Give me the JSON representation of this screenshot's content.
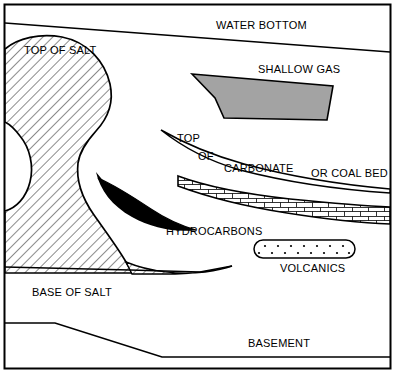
{
  "figure": {
    "border_color": "#000000",
    "background_color": "#ffffff"
  },
  "colors": {
    "line": "#000000",
    "salt_fill": "#ffffff",
    "salt_hatch": "#000000",
    "shallow_gas_fill": "#a3a3a3",
    "hydrocarbons_fill": "#000000",
    "carbonate_fill": "#ffffff",
    "volcanics_fill": "#ffffff"
  },
  "labels": {
    "water_bottom": "WATER BOTTOM",
    "top_of_salt": "TOP OF SALT",
    "shallow_gas": "SHALLOW GAS",
    "top": "TOP",
    "of": "OF",
    "carbonate": "CARBONATE",
    "or_coal_bed": "OR COAL BED",
    "hydrocarbons": "HYDROCARBONS",
    "volcanics": "VOLCANICS",
    "base_of_salt": "BASE OF SALT",
    "basement": "BASEMENT"
  },
  "features": [
    {
      "name": "water-bottom",
      "label": "WATER BOTTOM",
      "type": "horizon-line",
      "description": "Gently dipping seafloor horizon across top of section"
    },
    {
      "name": "salt-body",
      "label": "TOP OF SALT",
      "type": "hatched-body",
      "description": "Diagonally hatched salt diapir occupying left portion"
    },
    {
      "name": "shallow-gas",
      "label": "SHALLOW GAS",
      "type": "filled-polygon",
      "description": "Grey shaded gas anomaly in upper right"
    },
    {
      "name": "carbonate-or-coal-bed",
      "label": "CARBONATE OR COAL BED",
      "type": "brick-pattern-band",
      "description": "Brick patterned dipping bed in right half"
    },
    {
      "name": "hydrocarbons",
      "label": "HYDROCARBONS",
      "type": "solid-black-wedge",
      "description": "Black crescent trapped against salt flank"
    },
    {
      "name": "volcanics",
      "label": "VOLCANICS",
      "type": "dotted-lens",
      "description": "Stadium shaped dotted lens right of centre"
    },
    {
      "name": "base-of-salt",
      "label": "BASE OF SALT",
      "type": "horizon-line",
      "description": "Base horizon under salt body"
    },
    {
      "name": "basement",
      "label": "BASEMENT",
      "type": "horizon-line",
      "description": "Stepped basement horizon at base of section"
    }
  ]
}
